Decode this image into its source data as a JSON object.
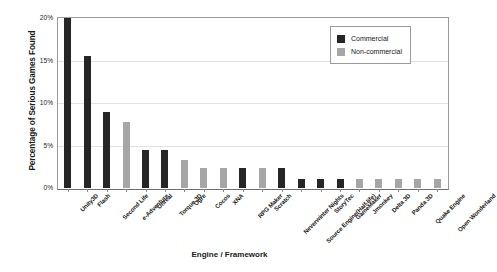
{
  "chart_data": {
    "type": "bar",
    "title": "",
    "xlabel": "Engine / Framework",
    "ylabel": "Percentage of Serious Games Found",
    "ylim": [
      0,
      20
    ],
    "ytick_labels": [
      "0%",
      "5%",
      "10%",
      "15%",
      "20%"
    ],
    "ytick_values": [
      0,
      5,
      10,
      15,
      20
    ],
    "grid": true,
    "legend_position": "top-right",
    "categories": [
      "Unity3D",
      "Flash",
      "Second Life",
      "e-Adventure",
      "Unreal",
      "Torque 3D",
      "Ogre",
      "Cocos",
      "XNA",
      "RPG Maker",
      "Scratch",
      "Neverwinter Nights",
      "Source Engine(Half-life)",
      "StoryTec",
      "GameMaker",
      "Jmonkey",
      "Delta 3D",
      "Panda 3D",
      "Quake Engine",
      "Open Wonderland"
    ],
    "values": [
      20.0,
      15.5,
      9.0,
      7.8,
      4.5,
      4.5,
      3.3,
      2.3,
      2.3,
      2.3,
      2.3,
      2.3,
      1.1,
      1.1,
      1.1,
      1.1,
      1.1,
      1.1,
      1.1,
      1.1
    ],
    "bar_series": [
      "Commercial",
      "Commercial",
      "Commercial",
      "Non-commercial",
      "Commercial",
      "Commercial",
      "Non-commercial",
      "Non-commercial",
      "Non-commercial",
      "Commercial",
      "Non-commercial",
      "Commercial",
      "Commercial",
      "Commercial",
      "Commercial",
      "Non-commercial",
      "Non-commercial",
      "Non-commercial",
      "Non-commercial",
      "Non-commercial"
    ],
    "series": [
      {
        "name": "Commercial",
        "color": "#262626",
        "points": [
          {
            "category": "Unity3D",
            "value": 20.0
          },
          {
            "category": "Flash",
            "value": 15.5
          },
          {
            "category": "Second Life",
            "value": 9.0
          },
          {
            "category": "Unreal",
            "value": 4.5
          },
          {
            "category": "Torque 3D",
            "value": 4.5
          },
          {
            "category": "RPG Maker",
            "value": 2.3
          },
          {
            "category": "Neverwinter Nights",
            "value": 2.3
          },
          {
            "category": "Source Engine(Half-life)",
            "value": 1.1
          },
          {
            "category": "StoryTec",
            "value": 1.1
          },
          {
            "category": "GameMaker",
            "value": 1.1
          }
        ]
      },
      {
        "name": "Non-commercial",
        "color": "#a6a6a6",
        "points": [
          {
            "category": "e-Adventure",
            "value": 7.8
          },
          {
            "category": "Ogre",
            "value": 3.3
          },
          {
            "category": "Cocos",
            "value": 2.3
          },
          {
            "category": "XNA",
            "value": 2.3
          },
          {
            "category": "Scratch",
            "value": 2.3
          },
          {
            "category": "Jmonkey",
            "value": 1.1
          },
          {
            "category": "Delta 3D",
            "value": 1.1
          },
          {
            "category": "Panda 3D",
            "value": 1.1
          },
          {
            "category": "Quake Engine",
            "value": 1.1
          },
          {
            "category": "Open Wonderland",
            "value": 1.1
          }
        ]
      }
    ]
  },
  "legend": {
    "entries": [
      {
        "label": "Commercial",
        "color": "#262626"
      },
      {
        "label": "Non-commercial",
        "color": "#a6a6a6"
      }
    ]
  },
  "colors": {
    "commercial": "#262626",
    "non_commercial": "#a6a6a6",
    "gridline": "#e2e2e2",
    "axis": "#8c8c8c",
    "text": "#1a1a1a",
    "background": "#ffffff"
  }
}
